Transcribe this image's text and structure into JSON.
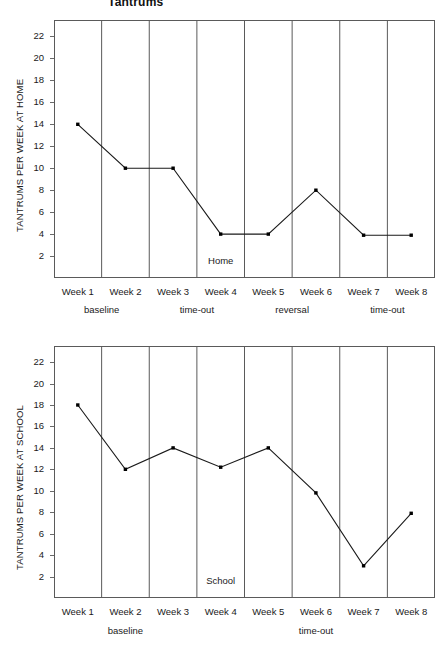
{
  "title": "Tantrums",
  "charts": [
    {
      "id": "home",
      "ylabel": "TANTRUMS PER WEEK AT HOME",
      "panel_label": "Home",
      "chart_data": {
        "type": "line",
        "title": "Tantrums",
        "xlabel": "",
        "ylabel": "TANTRUMS PER WEEK AT HOME",
        "categories": [
          "Week 1",
          "Week 2",
          "Week 3",
          "Week 4",
          "Week 5",
          "Week 6",
          "Week 7",
          "Week 8"
        ],
        "values": [
          14,
          10,
          10,
          4,
          4,
          8,
          3.9,
          3.9
        ],
        "yticks": [
          2,
          4,
          6,
          8,
          10,
          12,
          14,
          16,
          18,
          20,
          22
        ],
        "ylim": [
          0,
          23.5
        ],
        "grid": "vertical-panel-dividers",
        "legend": "none",
        "annotations": [
          "Home"
        ]
      },
      "phases": [
        {
          "label": "baseline",
          "start": 1,
          "end": 2,
          "left_arrow": true,
          "right_arrow": true
        },
        {
          "label": "time-out",
          "start": 3,
          "end": 4,
          "left_arrow": true,
          "right_arrow": true
        },
        {
          "label": "reversal",
          "start": 5,
          "end": 6,
          "left_arrow": true,
          "right_arrow": true
        },
        {
          "label": "time-out",
          "start": 7,
          "end": 8,
          "left_arrow": true,
          "right_arrow": true
        }
      ]
    },
    {
      "id": "school",
      "ylabel": "TANTRUMS PER WEEK AT SCHOOL",
      "panel_label": "School",
      "chart_data": {
        "type": "line",
        "title": "",
        "xlabel": "",
        "ylabel": "TANTRUMS PER WEEK AT SCHOOL",
        "categories": [
          "Week 1",
          "Week 2",
          "Week 3",
          "Week 4",
          "Week 5",
          "Week 6",
          "Week 7",
          "Week 8"
        ],
        "values": [
          18,
          12,
          14,
          12.2,
          14,
          9.8,
          3,
          7.9
        ],
        "yticks": [
          2,
          4,
          6,
          8,
          10,
          12,
          14,
          16,
          18,
          20,
          22
        ],
        "ylim": [
          0,
          23.5
        ],
        "grid": "vertical-panel-dividers",
        "legend": "none",
        "annotations": [
          "School"
        ]
      },
      "phases": [
        {
          "label": "baseline",
          "start": 1,
          "end": 3,
          "left_arrow": true,
          "right_arrow": true
        },
        {
          "label": "time-out",
          "start": 4,
          "end": 8,
          "left_arrow": true,
          "right_arrow": true
        }
      ]
    }
  ],
  "colors": {
    "line": "#1a1a1a",
    "marker": "#000000",
    "frame": "#5a5a5a",
    "text": "#1a1a1a",
    "background": "#ffffff"
  }
}
